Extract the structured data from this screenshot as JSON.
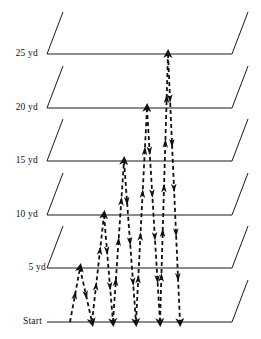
{
  "figure": {
    "type": "diagram",
    "width": 261,
    "height": 339,
    "background_color": "#ffffff",
    "line_color": "#1a1a1a",
    "path_color": "#111111"
  },
  "markers": [
    {
      "id": "m25",
      "label": "25 yd",
      "y": 54,
      "distance_yd": 25,
      "label_x": 14,
      "label_y": 49
    },
    {
      "id": "m20",
      "label": "20 yd",
      "y": 108,
      "distance_yd": 20,
      "label_x": 14,
      "label_y": 103
    },
    {
      "id": "m15",
      "label": "15 yd",
      "y": 161,
      "distance_yd": 15,
      "label_x": 14,
      "label_y": 156
    },
    {
      "id": "m10",
      "label": "10 yd",
      "y": 215,
      "distance_yd": 10,
      "label_x": 14,
      "label_y": 210
    },
    {
      "id": "m5",
      "label": "5 yd",
      "y": 268,
      "distance_yd": 5,
      "label_x": 22,
      "label_y": 263
    },
    {
      "id": "start",
      "label": "Start",
      "y": 322,
      "distance_yd": 0,
      "label_x": 18,
      "label_y": 317
    }
  ],
  "geometry": {
    "horizontal_x_start": 47,
    "horizontal_x_end": 232,
    "slant_dx": 16,
    "slant_dy": -42,
    "line_width": 1,
    "start_line_has_slants": false,
    "start_line_right_slant": true,
    "lane_spacing_px": 53.5
  },
  "paths": {
    "description": "Dashed out-and-back shuttle runs from the Start line, each reaching progressively farther turnaround lines.",
    "dash_pattern": "4,3",
    "stroke_width": 1.8,
    "arrow_size": 4.5,
    "runs": [
      {
        "id": "run-1",
        "turnaround": "5 yd",
        "out_start_x": 70,
        "turn_x": 80,
        "back_end_x": 92
      },
      {
        "id": "run-2",
        "turnaround": "10 yd",
        "out_start_x": 92,
        "turn_x": 104,
        "back_end_x": 113
      },
      {
        "id": "run-3",
        "turnaround": "15 yd",
        "out_start_x": 113,
        "turn_x": 124,
        "back_end_x": 136
      },
      {
        "id": "run-4",
        "turnaround": "20 yd",
        "out_start_x": 136,
        "turn_x": 147,
        "back_end_x": 160
      },
      {
        "id": "run-5",
        "turnaround": "25 yd",
        "out_start_x": 160,
        "turn_x": 168,
        "back_end_x": 180
      }
    ]
  }
}
